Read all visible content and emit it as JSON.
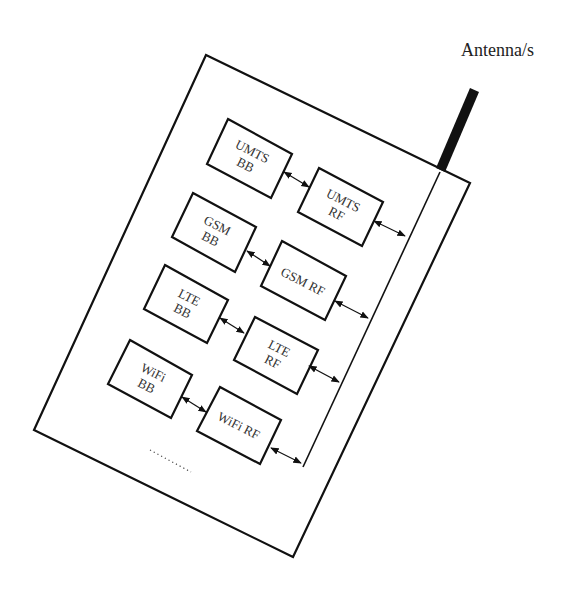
{
  "diagram": {
    "antenna_label": "Antenna/s",
    "ellipsis": "………",
    "blocks": [
      {
        "id": "umts-bb",
        "line1": "UMTS",
        "line2": "BB"
      },
      {
        "id": "umts-rf",
        "line1": "UMTS",
        "line2": "RF"
      },
      {
        "id": "gsm-bb",
        "line1": "GSM",
        "line2": "BB"
      },
      {
        "id": "gsm-rf",
        "line1": "GSM RF",
        "line2": ""
      },
      {
        "id": "lte-bb",
        "line1": "LTE",
        "line2": "BB"
      },
      {
        "id": "lte-rf",
        "line1": "LTE",
        "line2": "RF"
      },
      {
        "id": "wifi-bb",
        "line1": "WiFi",
        "line2": "BB"
      },
      {
        "id": "wifi-rf",
        "line1": "WiFi RF",
        "line2": ""
      }
    ],
    "connections": [
      {
        "from": "umts-bb",
        "to": "umts-rf",
        "type": "bidirectional"
      },
      {
        "from": "gsm-bb",
        "to": "gsm-rf",
        "type": "bidirectional"
      },
      {
        "from": "lte-bb",
        "to": "lte-rf",
        "type": "bidirectional"
      },
      {
        "from": "wifi-bb",
        "to": "wifi-rf",
        "type": "bidirectional"
      },
      {
        "from": "umts-rf",
        "to": "antenna-bus",
        "type": "bidirectional"
      },
      {
        "from": "gsm-rf",
        "to": "antenna-bus",
        "type": "bidirectional"
      },
      {
        "from": "lte-rf",
        "to": "antenna-bus",
        "type": "bidirectional"
      },
      {
        "from": "wifi-rf",
        "to": "antenna-bus",
        "type": "bidirectional"
      }
    ],
    "colors": {
      "stroke": "#111111",
      "text": "#333333",
      "background": "#ffffff"
    }
  }
}
